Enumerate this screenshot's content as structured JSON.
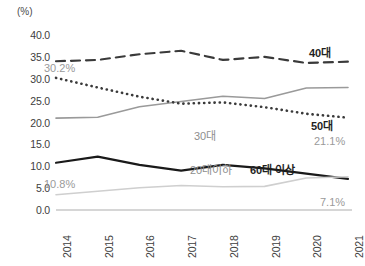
{
  "chart_data": {
    "type": "line",
    "title": "",
    "xlabel": "",
    "ylabel": "(%)",
    "unit_label": "(%)",
    "categories": [
      "2014",
      "2015",
      "2016",
      "2017",
      "2018",
      "2019",
      "2020",
      "2021"
    ],
    "ylim": [
      0.0,
      40.0
    ],
    "ytick_step": 5.0,
    "yticks": [
      "40.0",
      "35.0",
      "30.0",
      "25.0",
      "20.0",
      "15.0",
      "10.0",
      "5.0",
      "0.0"
    ],
    "ytick_values": [
      40.0,
      35.0,
      30.0,
      25.0,
      20.0,
      15.0,
      10.0,
      5.0,
      0.0
    ],
    "grid": false,
    "legend": "inline-right",
    "series": [
      {
        "name": "40대",
        "label": "40대",
        "style": "dashed",
        "color": "#3a3a3a",
        "values": [
          34.0,
          34.3,
          35.6,
          36.4,
          34.3,
          35.0,
          33.6,
          33.9
        ]
      },
      {
        "name": "50대",
        "label": "50대",
        "style": "solid",
        "color": "#9a9a9a",
        "values": [
          21.0,
          21.2,
          23.6,
          24.8,
          26.0,
          25.5,
          27.9,
          28.0
        ]
      },
      {
        "name": "30대",
        "label": "30대",
        "style": "dotted",
        "color": "#3a3a3a",
        "values": [
          30.2,
          28.0,
          25.9,
          24.3,
          24.6,
          23.5,
          22.0,
          21.1
        ],
        "start_value_label": "30.2%",
        "end_value_label": "21.1%"
      },
      {
        "name": "60대 이상",
        "label": "60대 이상",
        "style": "solid",
        "color": "#1a1a1a",
        "values": [
          10.8,
          12.2,
          10.3,
          9.0,
          10.3,
          9.5,
          8.3,
          7.1
        ],
        "start_value_label": "10.8%",
        "end_value_label": "7.1%"
      },
      {
        "name": "20대이하",
        "label": "20대이하",
        "style": "solid",
        "color": "#cfcfcf",
        "values": [
          3.5,
          4.3,
          5.1,
          5.6,
          5.3,
          5.4,
          7.3,
          7.6
        ]
      }
    ],
    "annotations": [
      {
        "text": "30.2%",
        "series": "30대",
        "position": "start"
      },
      {
        "text": "10.8%",
        "series": "60대 이상",
        "position": "start"
      },
      {
        "text": "21.1%",
        "series": "30대",
        "position": "end"
      },
      {
        "text": "7.1%",
        "series": "20대이하",
        "position": "end"
      }
    ]
  }
}
